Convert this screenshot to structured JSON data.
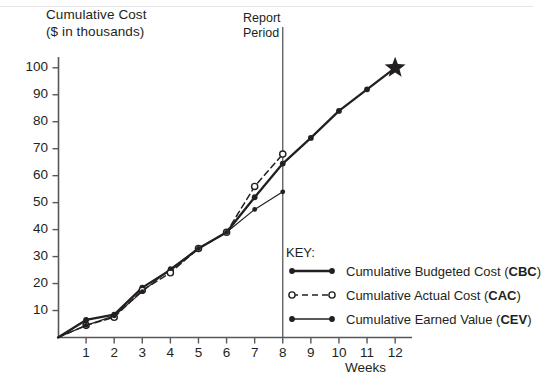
{
  "chart_data": {
    "type": "line",
    "title": "",
    "ylabel": "Cumulative Cost\n($ in thousands)",
    "ylabel_line1": "Cumulative Cost",
    "ylabel_line2": "($ in thousands)",
    "xlabel": "Weeks",
    "xlim": [
      0,
      12.6
    ],
    "ylim": [
      0,
      104
    ],
    "grid": false,
    "x_ticks": [
      1,
      2,
      3,
      4,
      5,
      6,
      7,
      8,
      9,
      10,
      11,
      12
    ],
    "y_ticks": [
      10,
      20,
      30,
      40,
      50,
      60,
      70,
      80,
      90,
      100
    ],
    "legend_position": "inside-lower-right",
    "legend_title": "KEY:",
    "annotations": [
      {
        "name": "report-period",
        "label_line1": "Report",
        "label_line2": "Period",
        "x": 8,
        "type": "vertical-line"
      },
      {
        "name": "target-star",
        "x": 12,
        "y": 100,
        "marker": "star",
        "color": "#231f20"
      }
    ],
    "series": [
      {
        "name": "Cumulative Budgeted Cost",
        "abbr": "CBC",
        "style": "solid-thick",
        "marker": "filled-circle",
        "color": "#231f20",
        "x": [
          0,
          1,
          2,
          3,
          4,
          5,
          6,
          7,
          8,
          9,
          10,
          11,
          12
        ],
        "values": [
          0,
          6.5,
          8.5,
          18.5,
          25,
          33,
          39,
          52,
          64.5,
          74,
          84,
          92,
          100
        ]
      },
      {
        "name": "Cumulative Actual Cost",
        "abbr": "CAC",
        "style": "dashed",
        "marker": "hollow-circle",
        "color": "#231f20",
        "x": [
          0,
          1,
          2,
          3,
          4,
          5,
          6,
          7,
          8
        ],
        "values": [
          0,
          4.5,
          7.5,
          17.5,
          24,
          33,
          39,
          56,
          68
        ]
      },
      {
        "name": "Cumulative Earned Value",
        "abbr": "CEV",
        "style": "solid-thin",
        "marker": "filled-circle",
        "color": "#231f20",
        "x": [
          0,
          1,
          2,
          3,
          4,
          5,
          6,
          7,
          8
        ],
        "values": [
          0,
          4.5,
          8,
          17,
          25.5,
          33,
          39,
          47.5,
          54
        ]
      }
    ]
  },
  "legend": {
    "title": "KEY:",
    "items": [
      {
        "label": "Cumulative Budgeted Cost (",
        "abbr": "CBC",
        "tail": ")",
        "style": "solid-thick",
        "marker": "filled-circle"
      },
      {
        "label": "Cumulative Actual Cost (",
        "abbr": "CAC",
        "tail": ")",
        "style": "dashed",
        "marker": "hollow-circle"
      },
      {
        "label": "Cumulative Earned Value (",
        "abbr": "CEV",
        "tail": ")",
        "style": "solid-thin",
        "marker": "filled-circle"
      }
    ]
  },
  "colors": {
    "ink": "#231f20",
    "axis": "#58585b",
    "background": "#ffffff"
  }
}
